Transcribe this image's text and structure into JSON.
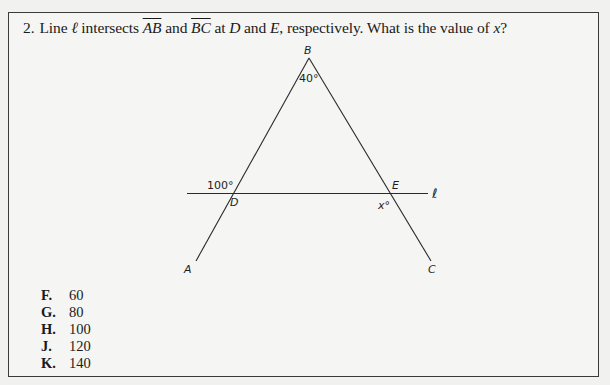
{
  "question": {
    "number": "2.",
    "text_parts": {
      "p1": "Line ",
      "line_name": "ℓ",
      "p2": " intersects ",
      "seg1": "AB",
      "p3": " and ",
      "seg2": "BC",
      "p4": " at ",
      "pt1": "D",
      "p5": " and ",
      "pt2": "E",
      "p6": ", respectively. What is the value of ",
      "var": "x",
      "p7": "?"
    }
  },
  "figure": {
    "points": {
      "A": "A",
      "B": "B",
      "C": "C",
      "D": "D",
      "E": "E"
    },
    "line_label": "ℓ",
    "angles": {
      "at_B": "40°",
      "at_D": "100°",
      "at_E": "x°"
    }
  },
  "choices": [
    {
      "letter": "F.",
      "value": "60"
    },
    {
      "letter": "G.",
      "value": "80"
    },
    {
      "letter": "H.",
      "value": "100"
    },
    {
      "letter": "J.",
      "value": "120"
    },
    {
      "letter": "K.",
      "value": "140"
    }
  ]
}
